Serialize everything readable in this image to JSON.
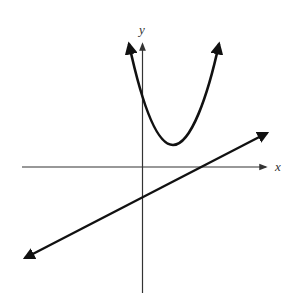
{
  "diagram": {
    "type": "coordinate-graph",
    "axes": {
      "x_label": "x",
      "y_label": "y",
      "origin_px": [
        142,
        167
      ]
    },
    "curves": [
      {
        "name": "parabola",
        "shape": "upward-opening parabola",
        "vertex_px": [
          173,
          145
        ],
        "arrows": "both ends"
      },
      {
        "name": "line",
        "shape": "straight line, positive slope",
        "y_intercept_px": [
          142,
          194
        ],
        "arrows": "both ends"
      }
    ],
    "colors": {
      "stroke": "#111111",
      "axis": "#333333",
      "background": "#ffffff"
    }
  }
}
